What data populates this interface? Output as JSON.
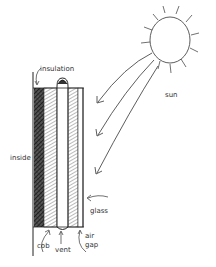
{
  "diagram": {
    "type": "trombe-wall-sketch",
    "labels": {
      "insulation": "insulation",
      "sun": "sun",
      "inside": "inside",
      "glass": "glass",
      "cob": "cob",
      "vent": "vent",
      "air": "air",
      "gap": "gap"
    },
    "colors": {
      "ink": "#2a2a2a",
      "hatch": "#444444",
      "background": "#ffffff"
    }
  }
}
